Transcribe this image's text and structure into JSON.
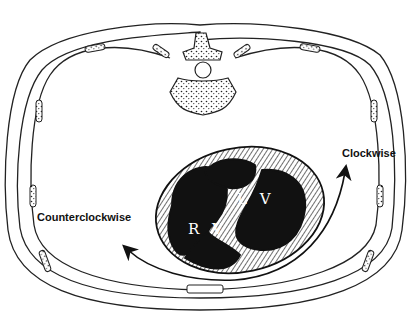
{
  "diagram": {
    "labels": {
      "clockwise": "Clockwise",
      "counterclockwise": "Counterclockwise",
      "right_ventricle": "R V",
      "left_ventricle": "L V"
    },
    "colors": {
      "line": "#111111",
      "chamber_fill": "#111111",
      "background": "#ffffff"
    }
  }
}
